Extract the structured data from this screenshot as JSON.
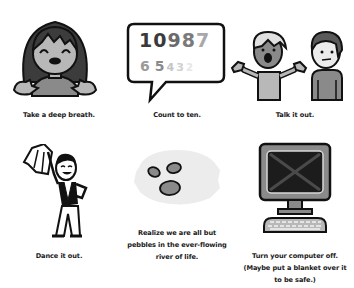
{
  "panels": [
    {
      "id": "breath",
      "caption_lines": [
        "Take a deep breath."
      ],
      "icon": "smiling-girl-icon"
    },
    {
      "id": "count",
      "caption_lines": [
        "Count to ten."
      ],
      "icon": "speech-bubble-numbers-icon",
      "bubble": {
        "row1": [
          "1",
          "0",
          "9",
          "8",
          "7"
        ],
        "row2": [
          "6",
          "5",
          "4",
          "3",
          "2"
        ],
        "row1_colors": [
          "#3a3a3a",
          "#3a3a3a",
          "#6a6a6a",
          "#7a7a7a",
          "#a8a8a8"
        ],
        "row2_colors": [
          "#9a9a9a",
          "#8a8a8a",
          "#c4c4c4",
          "#cfcfcf",
          "#e6e6e6"
        ]
      }
    },
    {
      "id": "talk",
      "caption_lines": [
        "Talk it out."
      ],
      "icon": "two-people-talking-icon"
    },
    {
      "id": "dance",
      "caption_lines": [
        "Dance it out."
      ],
      "icon": "dancing-person-icon"
    },
    {
      "id": "pebbles",
      "caption_lines": [
        "Realize we are all but",
        "pebbles in the ever-flowing",
        "river of life."
      ],
      "icon": "pebbles-in-river-icon"
    },
    {
      "id": "computer",
      "caption_lines": [
        "Turn your computer off.",
        "(Maybe put a blanket over it",
        "to be safe.)"
      ],
      "icon": "computer-off-icon"
    }
  ],
  "colors": {
    "outline": "#111111",
    "dark_gray": "#3c3c3c",
    "mid_gray": "#8a8a8a",
    "light_gray": "#b8b8b8",
    "pale_gray": "#ececec",
    "text": "#1a1a1a"
  }
}
